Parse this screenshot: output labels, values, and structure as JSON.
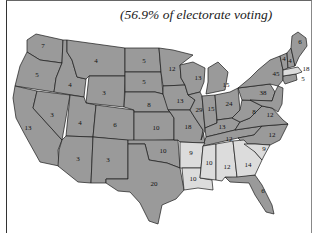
{
  "caption": "(56.9% of electorate voting)",
  "colors": {
    "winner_states": "#9a9a9a",
    "opponent_states": "#dcdcdc",
    "borders": "#1a1a1a",
    "background": "#ffffff"
  },
  "legend_note": "Dark gray = majority candidate states; light gray = opposing candidate states",
  "states": [
    {
      "name": "Washington",
      "electoral_votes": "7",
      "shade": "dark"
    },
    {
      "name": "Oregon",
      "electoral_votes": "5",
      "shade": "dark"
    },
    {
      "name": "California",
      "electoral_votes": "13",
      "shade": "dark"
    },
    {
      "name": "Idaho",
      "electoral_votes": "4",
      "shade": "dark"
    },
    {
      "name": "Nevada",
      "electoral_votes": "3",
      "shade": "dark"
    },
    {
      "name": "Montana",
      "electoral_votes": "4",
      "shade": "dark"
    },
    {
      "name": "Wyoming",
      "electoral_votes": "3",
      "shade": "dark"
    },
    {
      "name": "Utah",
      "electoral_votes": "4",
      "shade": "dark"
    },
    {
      "name": "Colorado",
      "electoral_votes": "6",
      "shade": "dark"
    },
    {
      "name": "Arizona",
      "electoral_votes": "3",
      "shade": "dark"
    },
    {
      "name": "New Mexico",
      "electoral_votes": "3",
      "shade": "dark"
    },
    {
      "name": "North Dakota",
      "electoral_votes": "5",
      "shade": "dark"
    },
    {
      "name": "South Dakota",
      "electoral_votes": "5",
      "shade": "dark"
    },
    {
      "name": "Nebraska",
      "electoral_votes": "8",
      "shade": "dark"
    },
    {
      "name": "Kansas",
      "electoral_votes": "10",
      "shade": "dark"
    },
    {
      "name": "Oklahoma",
      "electoral_votes": "10",
      "shade": "dark"
    },
    {
      "name": "Texas",
      "electoral_votes": "20",
      "shade": "dark"
    },
    {
      "name": "Minnesota",
      "electoral_votes": "12",
      "shade": "dark"
    },
    {
      "name": "Iowa",
      "electoral_votes": "13",
      "shade": "dark"
    },
    {
      "name": "Missouri",
      "electoral_votes": "18",
      "shade": "dark"
    },
    {
      "name": "Arkansas",
      "electoral_votes": "9",
      "shade": "light"
    },
    {
      "name": "Louisiana",
      "electoral_votes": "10",
      "shade": "light"
    },
    {
      "name": "Wisconsin",
      "electoral_votes": "13",
      "shade": "dark"
    },
    {
      "name": "Illinois",
      "electoral_votes": "29",
      "shade": "dark"
    },
    {
      "name": "Michigan",
      "electoral_votes": "15",
      "shade": "dark"
    },
    {
      "name": "Indiana",
      "electoral_votes": "15",
      "shade": "dark"
    },
    {
      "name": "Ohio",
      "electoral_votes": "24",
      "shade": "dark"
    },
    {
      "name": "Kentucky",
      "electoral_votes": "13",
      "shade": "dark"
    },
    {
      "name": "Tennessee",
      "electoral_votes": "12",
      "shade": "dark"
    },
    {
      "name": "Mississippi",
      "electoral_votes": "10",
      "shade": "light"
    },
    {
      "name": "Alabama",
      "electoral_votes": "12",
      "shade": "light"
    },
    {
      "name": "Georgia",
      "electoral_votes": "14",
      "shade": "light"
    },
    {
      "name": "Florida",
      "electoral_votes": "6",
      "shade": "dark"
    },
    {
      "name": "South Carolina",
      "electoral_votes": "9",
      "shade": "light"
    },
    {
      "name": "North Carolina",
      "electoral_votes": "12",
      "shade": "dark"
    },
    {
      "name": "Virginia",
      "electoral_votes": "12",
      "shade": "dark"
    },
    {
      "name": "West Virginia",
      "electoral_votes": "8",
      "shade": "dark"
    },
    {
      "name": "Pennsylvania",
      "electoral_votes": "38",
      "shade": "dark"
    },
    {
      "name": "New York",
      "electoral_votes": "45",
      "shade": "dark"
    },
    {
      "name": "Vermont",
      "electoral_votes": "4",
      "shade": "dark"
    },
    {
      "name": "New Hampshire",
      "electoral_votes": "4",
      "shade": "dark"
    },
    {
      "name": "Maine",
      "electoral_votes": "6",
      "shade": "dark"
    },
    {
      "name": "Massachusetts",
      "electoral_votes": "18",
      "shade": "light"
    },
    {
      "name": "Rhode Island / Connecticut",
      "electoral_votes": "5",
      "shade": "dark"
    }
  ]
}
